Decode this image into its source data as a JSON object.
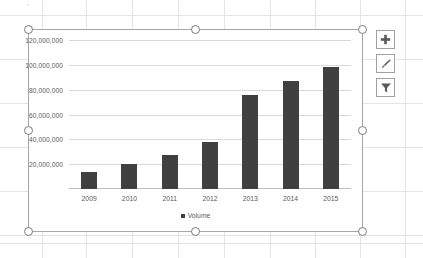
{
  "chart_data": {
    "type": "bar",
    "title": "",
    "xlabel": "",
    "ylabel": "",
    "categories": [
      "2009",
      "2010",
      "2011",
      "2012",
      "2013",
      "2014",
      "2015"
    ],
    "series": [
      {
        "name": "Volume",
        "values": [
          14000000,
          20000000,
          27000000,
          38000000,
          76000000,
          87000000,
          98000000
        ],
        "color": "#404040"
      }
    ],
    "ylim": [
      0,
      120000000
    ],
    "ytick_values": [
      0,
      20000000,
      40000000,
      60000000,
      80000000,
      100000000,
      120000000
    ],
    "ytick_labels": [
      "",
      "20,000,000",
      "40,000,000",
      "60,000,000",
      "80,000,000",
      "100,000,000",
      "120,000,000"
    ],
    "grid": true,
    "legend": {
      "position": "bottom",
      "entries": [
        "Volume"
      ]
    }
  },
  "chart_object": {
    "selected": true,
    "handle_count": 8,
    "border_color": "#a6a6a6"
  },
  "chart_buttons": [
    {
      "name": "chart-elements-button",
      "icon": "plus-icon",
      "label": "+"
    },
    {
      "name": "chart-styles-button",
      "icon": "brush-icon",
      "label": ""
    },
    {
      "name": "chart-filters-button",
      "icon": "funnel-icon",
      "label": ""
    }
  ],
  "sheet": {
    "gridline_color": "#e2e4e8",
    "h_lines": [
      15,
      59,
      103,
      147,
      191,
      235,
      243
    ],
    "v_lines": [
      42,
      86,
      132,
      178,
      224,
      270,
      315,
      360,
      405
    ],
    "stray_mark": "'"
  }
}
